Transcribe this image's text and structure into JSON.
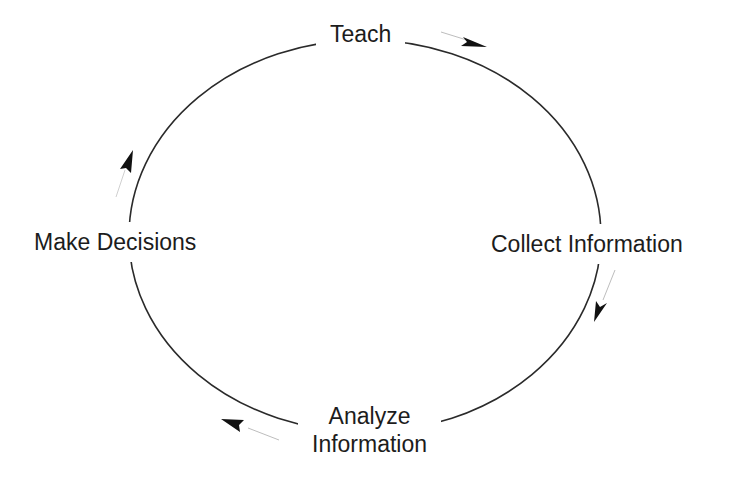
{
  "diagram": {
    "title": "",
    "type": "cycle",
    "direction": "clockwise",
    "nodes": [
      {
        "id": "teach",
        "label": "Teach"
      },
      {
        "id": "collect",
        "label": "Collect Information"
      },
      {
        "id": "analyze",
        "label": "Analyze Information",
        "lines": [
          "Analyze",
          "Information"
        ]
      },
      {
        "id": "decide",
        "label": "Make Decisions"
      }
    ],
    "edges": [
      {
        "from": "teach",
        "to": "collect"
      },
      {
        "from": "collect",
        "to": "analyze"
      },
      {
        "from": "analyze",
        "to": "decide"
      },
      {
        "from": "decide",
        "to": "teach"
      }
    ],
    "colors": {
      "line": "#2a2a2a",
      "arrow_head": "#111111",
      "arrow_tail": "#bdbdbd",
      "background": "#ffffff"
    }
  }
}
